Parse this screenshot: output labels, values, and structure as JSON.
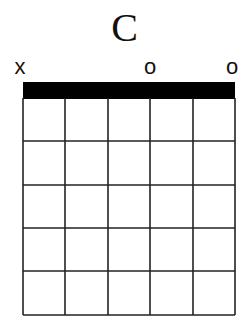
{
  "chord": {
    "name": "C",
    "strings": 6,
    "frets_shown": 5,
    "string_markers": [
      "x",
      "",
      "",
      "o",
      "",
      "o"
    ],
    "finger_positions": []
  },
  "colors": {
    "line": "#222222",
    "nut": "#000000",
    "background": "#ffffff"
  }
}
